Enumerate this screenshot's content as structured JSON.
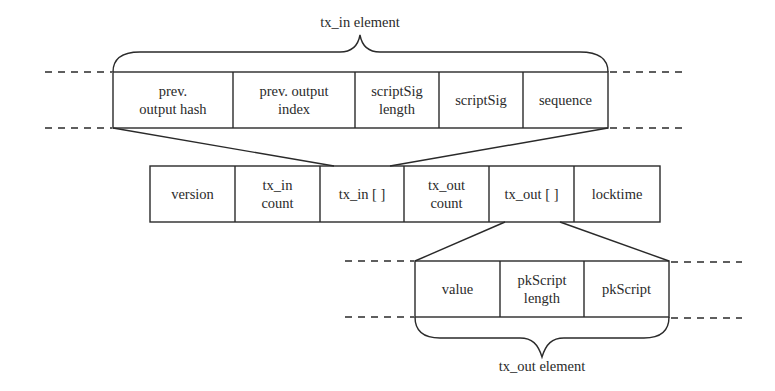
{
  "diagram": {
    "tx_in_element": {
      "label": "tx_in element",
      "fields": [
        {
          "label": "prev.\noutput hash"
        },
        {
          "label": "prev. output\nindex"
        },
        {
          "label": "scriptSig\nlength"
        },
        {
          "label": "scriptSig"
        },
        {
          "label": "sequence"
        }
      ]
    },
    "transaction": {
      "fields": [
        {
          "label": "version"
        },
        {
          "label": "tx_in\ncount"
        },
        {
          "label": "tx_in [ ]"
        },
        {
          "label": "tx_out\ncount"
        },
        {
          "label": "tx_out [ ]"
        },
        {
          "label": "locktime"
        }
      ]
    },
    "tx_out_element": {
      "label": "tx_out element",
      "fields": [
        {
          "label": "value"
        },
        {
          "label": "pkScript\nlength"
        },
        {
          "label": "pkScript"
        }
      ]
    },
    "colors": {
      "line": "#2a2a2a",
      "background": "#ffffff"
    }
  }
}
